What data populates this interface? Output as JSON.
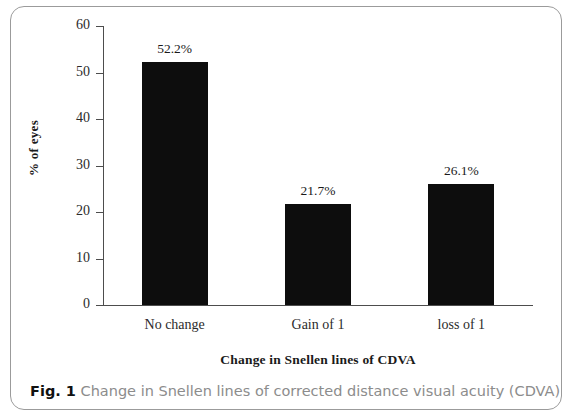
{
  "figure": {
    "caption_label": "Fig. 1",
    "caption_text": "Change in Snellen lines of corrected distance visual acuity (CDVA)"
  },
  "chart_data": {
    "type": "bar",
    "title": "",
    "categories": [
      "No change",
      "Gain of 1",
      "loss of 1"
    ],
    "values": [
      52.2,
      21.7,
      26.1
    ],
    "value_labels": [
      "52.2%",
      "21.7%",
      "26.1%"
    ],
    "xlabel": "Change in Snellen lines of CDVA",
    "ylabel": "% of eyes",
    "ylim": [
      0,
      60
    ],
    "yticks": [
      0,
      10,
      20,
      30,
      40,
      50,
      60
    ],
    "ytick_labels": [
      "0",
      "10",
      "20",
      "30",
      "40",
      "50",
      "60"
    ],
    "grid": false,
    "legend": false,
    "bar_color": "#0d0d0d",
    "axis_color": "#4d4d4d"
  }
}
